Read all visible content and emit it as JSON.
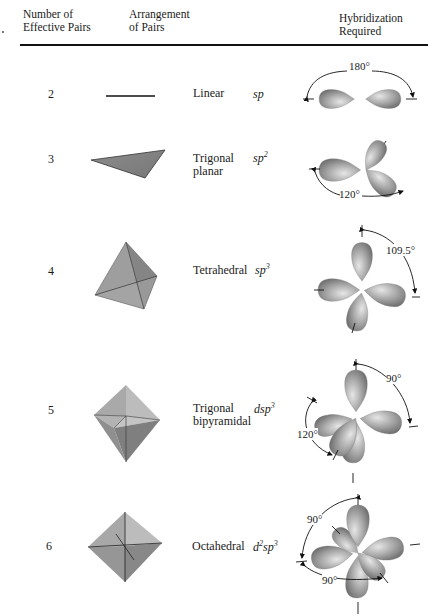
{
  "header": {
    "col_pairs": [
      "Number of",
      "Effective Pairs"
    ],
    "col_arrangement": [
      "Arrangement",
      "of Pairs"
    ],
    "col_hybridization": [
      "Hybridization",
      "Required"
    ]
  },
  "rows": [
    {
      "pairs": "2",
      "arrangement": [
        "Linear",
        ""
      ],
      "hybrid_prefix": "",
      "hybrid_prefix_sup": "",
      "hybrid_base": "sp",
      "hybrid_sup": "",
      "angles": [
        "180°"
      ]
    },
    {
      "pairs": "3",
      "arrangement": [
        "Trigonal",
        "planar"
      ],
      "hybrid_prefix": "",
      "hybrid_prefix_sup": "",
      "hybrid_base": "sp",
      "hybrid_sup": "2",
      "angles": [
        "120°"
      ]
    },
    {
      "pairs": "4",
      "arrangement": [
        "Tetrahedral",
        ""
      ],
      "hybrid_prefix": "",
      "hybrid_prefix_sup": "",
      "hybrid_base": "sp",
      "hybrid_sup": "3",
      "angles": [
        "109.5°"
      ]
    },
    {
      "pairs": "5",
      "arrangement": [
        "Trigonal",
        "bipyramidal"
      ],
      "hybrid_prefix": "d",
      "hybrid_prefix_sup": "",
      "hybrid_base": "sp",
      "hybrid_sup": "3",
      "angles": [
        "90°",
        "120°"
      ]
    },
    {
      "pairs": "6",
      "arrangement": [
        "Octahedral",
        ""
      ],
      "hybrid_prefix": "d",
      "hybrid_prefix_sup": "2",
      "hybrid_base": "sp",
      "hybrid_sup": "3",
      "angles": [
        "90°",
        "90°"
      ]
    }
  ],
  "colors": {
    "orbital_light": "#d9d9d9",
    "orbital_mid": "#a6a6a6",
    "orbital_dark": "#6f6f6f",
    "polyhedron_light": "#b8b8b8",
    "polyhedron_dark": "#8a8a8a",
    "line": "#111111"
  }
}
